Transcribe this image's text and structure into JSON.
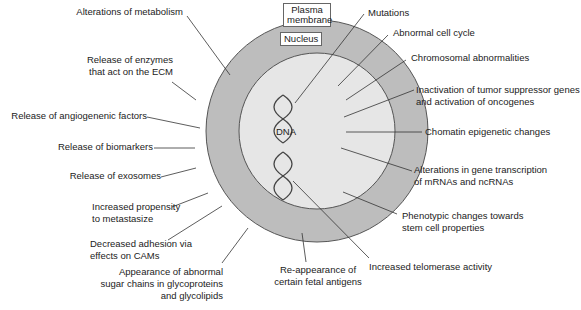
{
  "diagram": {
    "title": "",
    "colors": {
      "cytoplasm": "#bdbdbd",
      "nucleus": "#e6e6e6",
      "outline": "#555555",
      "leader_line": "#333333",
      "text": "#222222"
    },
    "structures": {
      "plasma_membrane_label": "Plasma\nmembrane",
      "nucleus_label": "Nucleus",
      "dna_label": "DNA"
    },
    "left_labels": [
      "Alterations of metabolism",
      "Release of enzymes\nthat act on the ECM",
      "Release of angiogenenic factors",
      "Release of biomarkers",
      "Release of exosomes",
      "Increased propensity\nto metastasize",
      "Decreased adhesion via\neffects on CAMs",
      "Appearance of abnormal\nsugar chains in glycoproteins\nand glycolipids"
    ],
    "bottom_labels": [
      "Re-appearance of\ncertain fetal antigens",
      "Increased telomerase activity"
    ],
    "right_labels": [
      "Mutations",
      "Abnormal cell cycle",
      "Chromosomal abnormalities",
      "Inactivation of tumor suppressor genes\nand activation of oncogenes",
      "Chomatin epigenetic changes",
      "Alterations in gene transcription\nof mRNAs and ncRNAs",
      "Phenotypic changes towards\nstem cell properties"
    ]
  }
}
